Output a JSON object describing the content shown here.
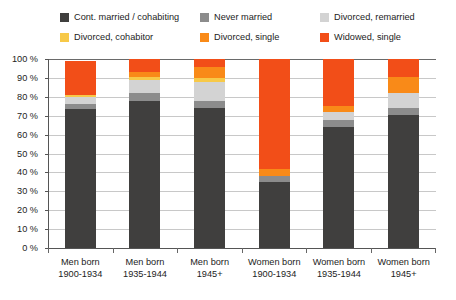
{
  "chart_data": {
    "type": "bar",
    "subtype": "stacked-bar-100-percent",
    "title": "",
    "xlabel": "",
    "ylabel": "",
    "ylim": [
      0,
      100
    ],
    "yticks": [
      "0 %",
      "10 %",
      "20 %",
      "30 %",
      "40 %",
      "50 %",
      "60 %",
      "70 %",
      "80 %",
      "90 %",
      "100 %"
    ],
    "ytick_values": [
      0,
      10,
      20,
      30,
      40,
      50,
      60,
      70,
      80,
      90,
      100
    ],
    "grid": true,
    "legend_position": "top",
    "categories": [
      "Men born 1900-1934",
      "Men born 1935-1944",
      "Men born 1945+",
      "Women born 1900-1934",
      "Women born 1935-1944",
      "Women born 1945+"
    ],
    "category_lines": [
      [
        "Men born",
        "1900-1934"
      ],
      [
        "Men born",
        "1935-1944"
      ],
      [
        "Men born",
        "1945+"
      ],
      [
        "Women born",
        "1900-1934"
      ],
      [
        "Women born",
        "1935-1944"
      ],
      [
        "Women born",
        "1945+"
      ]
    ],
    "series": [
      {
        "name": "Cont. married / cohabiting",
        "color": "#403F3E",
        "values": [
          73.5,
          78.0,
          74.0,
          35.0,
          64.0,
          70.5
        ]
      },
      {
        "name": "Never married",
        "color": "#8C8C8C",
        "values": [
          2.5,
          4.0,
          4.0,
          3.0,
          4.0,
          3.5
        ]
      },
      {
        "name": "Divorced, remarried",
        "color": "#D3D3D3",
        "values": [
          4.0,
          7.0,
          10.0,
          0.0,
          4.0,
          8.0
        ]
      },
      {
        "name": "Divorced, cohabitor",
        "color": "#F7C948",
        "values": [
          1.0,
          1.5,
          2.0,
          0.0,
          0.0,
          0.0
        ]
      },
      {
        "name": "Divorced, single",
        "color": "#F98A18",
        "values": [
          0.0,
          2.5,
          6.0,
          4.0,
          3.0,
          8.5
        ]
      },
      {
        "name": "Widowed, single",
        "color": "#F24E18",
        "values": [
          18.0,
          7.0,
          4.0,
          58.0,
          25.0,
          9.5
        ]
      }
    ]
  },
  "legend": {
    "items": [
      {
        "label": "Cont. married / cohabiting",
        "color": "#403F3E"
      },
      {
        "label": "Never married",
        "color": "#8C8C8C"
      },
      {
        "label": "Divorced, remarried",
        "color": "#D3D3D3"
      },
      {
        "label": "Divorced, cohabitor",
        "color": "#F7C948"
      },
      {
        "label": "Divorced, single",
        "color": "#F98A18"
      },
      {
        "label": "Widowed, single",
        "color": "#F24E18"
      }
    ]
  }
}
